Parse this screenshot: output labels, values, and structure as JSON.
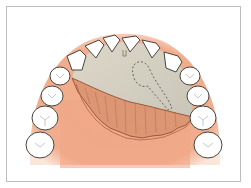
{
  "figure": {
    "colors": {
      "frame": "#bdbdbd",
      "gingiva": "#f0a787",
      "gingiva_light": "#f7c9b2",
      "palate_bone": "#cfcbbd",
      "flap": "#d9926f",
      "flap_edge": "#9a5a3c",
      "tooth_fill": "#ffffff",
      "tooth_outline": "#4a4440",
      "dashed_outline": "#6a6660"
    },
    "teeth_count": 14,
    "annotations": []
  }
}
